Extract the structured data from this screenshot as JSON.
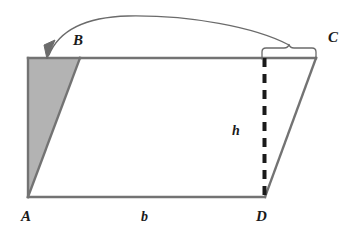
{
  "figure": {
    "shape_name": "parallelogram",
    "width": 360,
    "height": 241,
    "background_color": "#ffffff"
  },
  "labels": {
    "vertex_a": "A",
    "vertex_b": "B",
    "vertex_c": "C",
    "vertex_d": "D",
    "base": "b",
    "height": "h"
  },
  "colors": {
    "shading": "#b3b3b3",
    "shading_edge": "#8c8c8c",
    "outline": "#737373",
    "dashed_line": "#1a1a1a",
    "annotation": "#6b6b6b",
    "text": "#1a1a1a",
    "interior": "#ffffff"
  },
  "geometry": {
    "vertices": {
      "A": [
        28,
        197
      ],
      "B": [
        80,
        58
      ],
      "C": [
        316,
        58
      ],
      "D": [
        265,
        197
      ]
    },
    "left_triangle": [
      [
        28,
        58
      ],
      [
        80,
        58
      ],
      [
        28,
        197
      ]
    ],
    "right_triangle": [
      [
        265,
        58
      ],
      [
        316,
        58
      ],
      [
        265,
        197
      ]
    ],
    "dashed_height_line": {
      "x": 264.5,
      "y_top": 58,
      "y_bottom": 197,
      "dash_pattern": "9 7",
      "stroke_width": 4
    },
    "brace": {
      "x_start": 262,
      "x_end": 316,
      "y_baseline": 58,
      "tip_x": 289,
      "tip_y": 44
    },
    "arrow": {
      "start": [
        289,
        45
      ],
      "end": [
        48,
        57
      ],
      "arrowhead_angle_deg": 230
    }
  },
  "annotation_meaning": {
    "description": "Curved arrow indicating the right shaded triangle is translated onto the left shaded triangle"
  }
}
